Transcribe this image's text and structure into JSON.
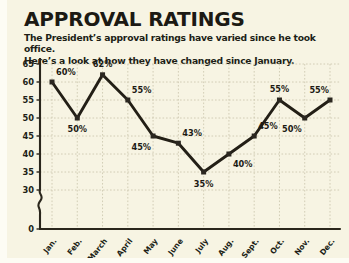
{
  "header": {
    "title": "APPROVAL RATINGS",
    "subtitle_line1": "The President’s approval ratings have varied since he took office.",
    "subtitle_line2": "Here’s a look at how they have changed since January."
  },
  "colors": {
    "background": "#f7f4e3",
    "line": "#231f16",
    "marker": "#2b2720",
    "axis": "#2a261c",
    "grid": "#c9c4ab",
    "text": "#1c1a14"
  },
  "chart_data": {
    "type": "line",
    "title": "APPROVAL RATINGS",
    "xlabel": "",
    "ylabel": "",
    "categories": [
      "Jan.",
      "Feb.",
      "March",
      "April",
      "May",
      "June",
      "July",
      "Aug.",
      "Sept.",
      "Oct.",
      "Nov.",
      "Dec."
    ],
    "values": [
      60,
      50,
      62,
      55,
      45,
      43,
      35,
      40,
      45,
      55,
      50,
      55
    ],
    "point_labels": [
      "60%",
      "50%",
      "62%",
      "55%",
      "45%",
      "43%",
      "35%",
      "40%",
      "45%",
      "55%",
      "50%",
      "55%"
    ],
    "label_positions": [
      "above",
      "below",
      "above",
      "above",
      "below",
      "above",
      "below",
      "below",
      "above",
      "above",
      "below",
      "above"
    ],
    "ylim": [
      30,
      65
    ],
    "yticks": [
      30,
      35,
      40,
      45,
      50,
      55,
      60,
      65
    ],
    "ytick_labels": [
      "30",
      "35",
      "40",
      "45",
      "50",
      "55",
      "60",
      "65"
    ],
    "y_zero_label": "0",
    "y_axis_break": true,
    "grid": true,
    "legend": "none",
    "units": "percent"
  },
  "yticks": [
    {
      "label": "65",
      "y": 0
    },
    {
      "label": "60",
      "y": 18
    },
    {
      "label": "55",
      "y": 36
    },
    {
      "label": "50",
      "y": 54
    },
    {
      "label": "45",
      "y": 72
    },
    {
      "label": "40",
      "y": 90
    },
    {
      "label": "35",
      "y": 108
    },
    {
      "label": "30",
      "y": 126
    },
    {
      "label": "0",
      "y": 157
    }
  ]
}
